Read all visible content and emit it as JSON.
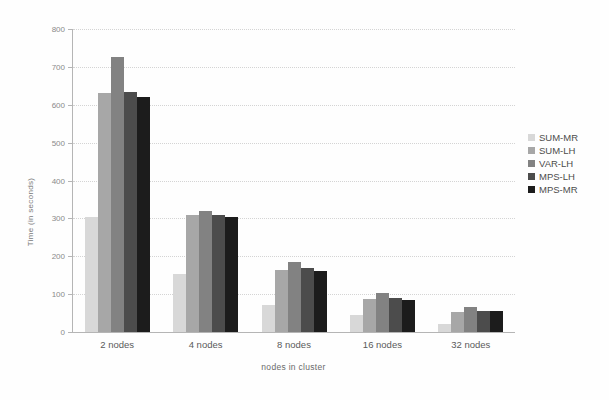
{
  "chart_data": {
    "type": "bar",
    "title": "",
    "xlabel": "nodes in cluster",
    "ylabel": "Time (in seconds)",
    "categories": [
      "2 nodes",
      "4 nodes",
      "8 nodes",
      "16 nodes",
      "32 nodes"
    ],
    "series": [
      {
        "name": "SUM-MR",
        "color": "#d8d8d8",
        "values": [
          303,
          153,
          71,
          45,
          22
        ]
      },
      {
        "name": "SUM-LH",
        "color": "#a7a7a7",
        "values": [
          630,
          308,
          164,
          88,
          53
        ]
      },
      {
        "name": "VAR-LH",
        "color": "#828282",
        "values": [
          725,
          320,
          185,
          104,
          66
        ]
      },
      {
        "name": "MPS-LH",
        "color": "#4c4c4c",
        "values": [
          635,
          310,
          168,
          90,
          56
        ]
      },
      {
        "name": "MPS-MR",
        "color": "#1c1c1c",
        "values": [
          620,
          303,
          161,
          84,
          55
        ]
      }
    ],
    "ylim": [
      0,
      800
    ],
    "yticks": [
      0,
      100,
      200,
      300,
      400,
      500,
      600,
      700,
      800
    ],
    "grid": true,
    "legend_position": "right"
  }
}
